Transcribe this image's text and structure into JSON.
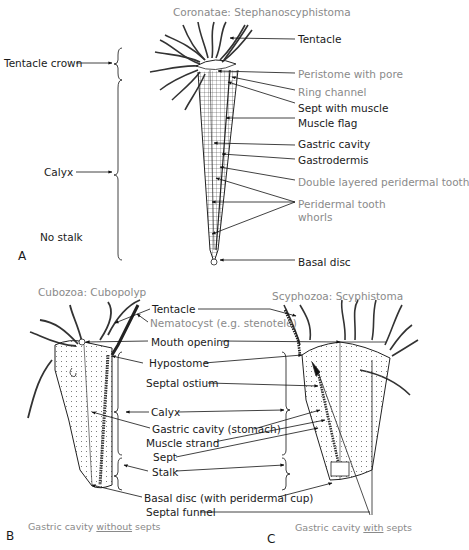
{
  "panel_a": {
    "title": "Coronatae: Stephanoscyphistoma",
    "letter": "A",
    "left_labels": {
      "tentacle_crown": "Tentacle crown",
      "calyx": "Calyx",
      "no_stalk": "No stalk"
    },
    "right_labels": [
      {
        "text": "Tentacle",
        "style": "dark"
      },
      {
        "text": "Peristome with pore",
        "style": "grey"
      },
      {
        "text": "Ring channel",
        "style": "grey"
      },
      {
        "text": "Sept with muscle",
        "style": "dark"
      },
      {
        "text": "Muscle flag",
        "style": "dark"
      },
      {
        "text": "Gastric cavity",
        "style": "dark"
      },
      {
        "text": "Gastrodermis",
        "style": "dark"
      },
      {
        "text": "Double layered peridermal tooth",
        "style": "grey"
      },
      {
        "text": "Peridermal tooth",
        "style": "grey"
      },
      {
        "text": "whorls",
        "style": "grey"
      },
      {
        "text": "Basal disc",
        "style": "dark"
      }
    ]
  },
  "panel_b": {
    "title": "Cubozoa: Cubopolyp",
    "letter": "B",
    "caption_pre": "Gastric cavity ",
    "caption_emph": "without",
    "caption_post": " septs"
  },
  "panel_c": {
    "title": "Scyphozoa: Scyphistoma",
    "letter": "C",
    "caption_pre": "Gastric cavity ",
    "caption_emph": "with",
    "caption_post": " septs"
  },
  "shared_labels": {
    "tentacle": "Tentacle",
    "nematocyst": "Nematocyst (e.g. stenotele)",
    "mouth_opening": "Mouth opening",
    "hypostome": "Hypostome",
    "septal_ostium": "Septal ostium",
    "calyx": "Calyx",
    "gastric_cavity": "Gastric cavity (stomach)",
    "muscle_strand": "Muscle strand",
    "sept": "Sept",
    "stalk": "Stalk",
    "basal_disc": "Basal disc (with peridermal cup)",
    "septal_funnel": "Septal funnel"
  }
}
